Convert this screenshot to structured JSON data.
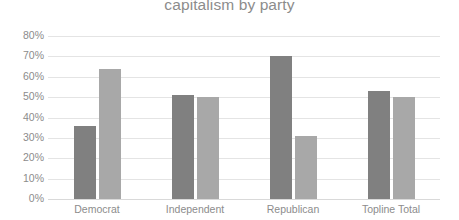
{
  "chart_data": {
    "type": "bar",
    "title": "capitalism by party",
    "xlabel": "",
    "ylabel": "",
    "ylim": [
      0,
      80
    ],
    "grid": true,
    "legend": "none",
    "categories": [
      "Democrat",
      "Independent",
      "Republican",
      "Topline Total"
    ],
    "ytick_labels": [
      "80%",
      "70%",
      "60%",
      "50%",
      "40%",
      "30%",
      "20%",
      "10%",
      "0%"
    ],
    "ytick_values": [
      80,
      70,
      60,
      50,
      40,
      30,
      20,
      10,
      0
    ],
    "series": [
      {
        "name": "Series 1",
        "color": "#808080",
        "values": [
          36,
          51,
          70,
          53
        ]
      },
      {
        "name": "Series 2",
        "color": "#a8a8a8",
        "values": [
          64,
          50,
          31,
          50
        ]
      }
    ],
    "colors": {
      "series_a": "#808080",
      "series_b": "#a8a8a8",
      "gridline": "#e4e4e4",
      "text": "#8c8c8c",
      "background": "#ffffff"
    }
  }
}
